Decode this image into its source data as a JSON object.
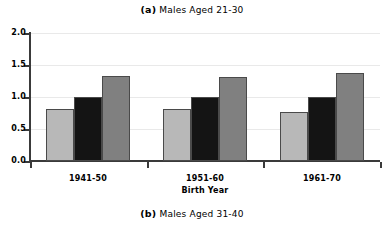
{
  "figure": {
    "panel_a": {
      "tag": "(a)",
      "text": "Males Aged 21-30"
    },
    "panel_b": {
      "tag": "(b)",
      "text": "Males Aged 31-40"
    }
  },
  "chart_data": {
    "type": "bar",
    "title": "(a) Males Aged 21-30",
    "subtitle": "(b) Males Aged 31-40",
    "xlabel": "Birth Year",
    "ylabel": "",
    "categories": [
      "1941-50",
      "1951-60",
      "1961-70"
    ],
    "ylim": [
      0.0,
      2.0
    ],
    "ytick_labels": [
      "0.0",
      "0.5",
      "1.0",
      "1.5",
      "2.0"
    ],
    "ytick_values": [
      0.0,
      0.5,
      1.0,
      1.5,
      2.0
    ],
    "grid": true,
    "legend": "none",
    "series": [
      {
        "name": "series-1",
        "color": "#b8b8b8",
        "values": [
          0.82,
          0.81,
          0.77
        ]
      },
      {
        "name": "series-2",
        "color": "#141414",
        "values": [
          1.0,
          1.0,
          1.0
        ]
      },
      {
        "name": "series-3",
        "color": "#808080",
        "values": [
          1.33,
          1.31,
          1.37
        ]
      }
    ]
  }
}
